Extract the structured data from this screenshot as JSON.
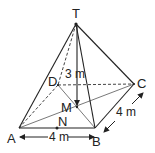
{
  "diagram": {
    "type": "square-pyramid",
    "vertices": {
      "T": {
        "label": "T",
        "x": 76,
        "y": 24
      },
      "A": {
        "label": "A",
        "x": 19,
        "y": 128
      },
      "B": {
        "label": "B",
        "x": 95,
        "y": 128
      },
      "C": {
        "label": "C",
        "x": 134,
        "y": 84
      },
      "D": {
        "label": "D",
        "x": 58,
        "y": 85
      },
      "M": {
        "label": "M",
        "x": 77,
        "y": 107
      },
      "N": {
        "label": "N",
        "x": 57,
        "y": 128
      }
    },
    "dimensions": {
      "height": "3 m",
      "base_ab": "4 m",
      "base_bc": "4 m"
    }
  }
}
